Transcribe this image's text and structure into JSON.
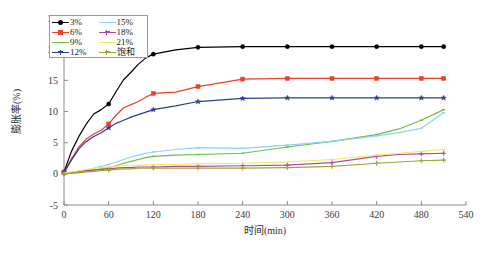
{
  "chart_data": {
    "type": "line",
    "title": "",
    "xlabel": "时间(min)",
    "ylabel": "膨胀率(%)",
    "xlim": [
      0,
      540
    ],
    "ylim": [
      -5,
      25
    ],
    "xticks": [
      "0",
      "60",
      "120",
      "180",
      "240",
      "300",
      "360",
      "420",
      "480",
      "540"
    ],
    "yticks": [
      "-5",
      "0",
      "5",
      "10",
      "15",
      "20",
      "25"
    ],
    "grid": false,
    "legend_position": "upper-left",
    "x": [
      0,
      10,
      20,
      30,
      40,
      50,
      60,
      70,
      80,
      90,
      100,
      110,
      120,
      150,
      180,
      240,
      300,
      360,
      420,
      450,
      480,
      510
    ],
    "series": [
      {
        "name": "3%",
        "color": "#000000",
        "marker": "circle",
        "values": [
          0.3,
          3.6,
          6.0,
          8.0,
          9.6,
          10.3,
          11.2,
          13.2,
          15.1,
          16.3,
          17.6,
          18.6,
          19.2,
          19.9,
          20.3,
          20.4,
          20.4,
          20.4,
          20.4,
          20.4,
          20.4,
          20.4
        ]
      },
      {
        "name": "6%",
        "color": "#e8412a",
        "marker": "square",
        "values": [
          0.2,
          2.4,
          4.3,
          5.6,
          6.4,
          7.0,
          8.0,
          9.4,
          10.6,
          11.1,
          11.6,
          12.3,
          12.9,
          13.1,
          14.0,
          15.2,
          15.3,
          15.3,
          15.3,
          15.3,
          15.3,
          15.3
        ]
      },
      {
        "name": "9%",
        "color": "#74bb43",
        "marker": "line",
        "values": [
          0.0,
          0.1,
          0.2,
          0.4,
          0.6,
          0.8,
          1.0,
          1.3,
          1.7,
          2.0,
          2.3,
          2.6,
          2.8,
          3.0,
          3.1,
          3.3,
          4.3,
          5.2,
          6.3,
          7.2,
          8.6,
          10.3
        ]
      },
      {
        "name": "12%",
        "color": "#2b3f8f",
        "marker": "star",
        "values": [
          0.2,
          2.2,
          4.0,
          5.2,
          6.0,
          6.6,
          7.4,
          8.1,
          8.6,
          9.1,
          9.5,
          9.9,
          10.3,
          10.9,
          11.6,
          12.1,
          12.2,
          12.2,
          12.2,
          12.2,
          12.2,
          12.2
        ]
      },
      {
        "name": "15%",
        "color": "#86d6ef",
        "marker": "line",
        "values": [
          0.0,
          0.2,
          0.4,
          0.6,
          0.9,
          1.2,
          1.5,
          1.9,
          2.3,
          2.7,
          3.0,
          3.3,
          3.5,
          3.9,
          4.2,
          4.1,
          4.6,
          5.2,
          6.1,
          6.6,
          7.3,
          9.8
        ]
      },
      {
        "name": "18%",
        "color": "#b04a9e",
        "marker": "plus",
        "values": [
          0.0,
          0.2,
          0.4,
          0.5,
          0.6,
          0.7,
          0.8,
          0.9,
          1.0,
          1.0,
          1.1,
          1.1,
          1.1,
          1.2,
          1.2,
          1.3,
          1.4,
          1.8,
          2.8,
          3.1,
          3.2,
          3.3
        ]
      },
      {
        "name": "21%",
        "color": "#f2e860",
        "marker": "line",
        "values": [
          0.1,
          0.3,
          0.5,
          0.7,
          0.9,
          1.0,
          1.1,
          1.2,
          1.3,
          1.3,
          1.4,
          1.4,
          1.5,
          1.5,
          1.6,
          1.7,
          1.9,
          2.3,
          3.0,
          3.3,
          3.6,
          3.9
        ]
      },
      {
        "name": "饱和",
        "color": "#9aa83a",
        "marker": "plus",
        "values": [
          0.0,
          0.1,
          0.2,
          0.3,
          0.4,
          0.5,
          0.6,
          0.7,
          0.8,
          0.8,
          0.9,
          0.9,
          0.9,
          0.9,
          0.9,
          0.9,
          1.0,
          1.2,
          1.7,
          1.9,
          2.1,
          2.2
        ]
      }
    ]
  },
  "legend": {
    "entries": [
      {
        "label": "3%",
        "color": "#000000",
        "marker": "circle"
      },
      {
        "label": "15%",
        "color": "#86d6ef",
        "marker": "line"
      },
      {
        "label": "6%",
        "color": "#e8412a",
        "marker": "square"
      },
      {
        "label": "18%",
        "color": "#b04a9e",
        "marker": "plus"
      },
      {
        "label": "9%",
        "color": "#74bb43",
        "marker": "line"
      },
      {
        "label": "21%",
        "color": "#f2e860",
        "marker": "line"
      },
      {
        "label": "12%",
        "color": "#2b3f8f",
        "marker": "star"
      },
      {
        "label": "饱和",
        "color": "#9aa83a",
        "marker": "plus"
      }
    ]
  }
}
